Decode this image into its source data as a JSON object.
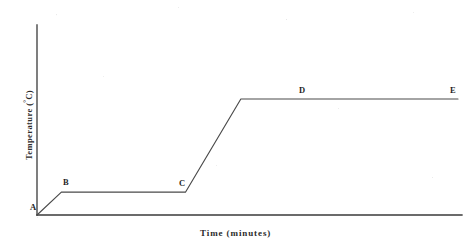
{
  "chart_data": {
    "type": "line",
    "title": "",
    "xlabel": "Time (minutes)",
    "ylabel": "Temperature (°C)",
    "ylabel_text": "Temperature (",
    "ylabel_degree": "°",
    "ylabel_tail": "C)",
    "grid": false,
    "legend": null,
    "xlim": [
      0,
      100
    ],
    "ylim": [
      0,
      100
    ],
    "x_ticks": [],
    "y_ticks": [],
    "axis_color": "#3a3a3a",
    "line_color": "#4a4a4a",
    "series": [
      {
        "name": "Heating curve",
        "x": [
          0,
          11,
          67,
          92,
          190
        ],
        "y": [
          0,
          12,
          12,
          61,
          61
        ],
        "point_labels": [
          "A",
          "B",
          "C",
          "D",
          "E"
        ]
      }
    ],
    "annotations": [
      {
        "label": "A",
        "x": 0,
        "y": 0,
        "note": "start of heating at origin"
      },
      {
        "label": "B",
        "x": 11,
        "y": 12,
        "note": "start of first plateau"
      },
      {
        "label": "C",
        "x": 67,
        "y": 12,
        "note": "end of first plateau"
      },
      {
        "label": "D",
        "x": 92,
        "y": 61,
        "note": "start of second plateau"
      },
      {
        "label": "E",
        "x": 190,
        "y": 61,
        "note": "end of curve"
      }
    ]
  },
  "labels": {
    "a": "A",
    "b": "B",
    "c": "C",
    "d": "D",
    "e": "E"
  },
  "axes": {
    "x_title": "Time (minutes)",
    "y_title_head": "Temperature (",
    "y_title_degree": "°",
    "y_title_tail": "C)"
  }
}
